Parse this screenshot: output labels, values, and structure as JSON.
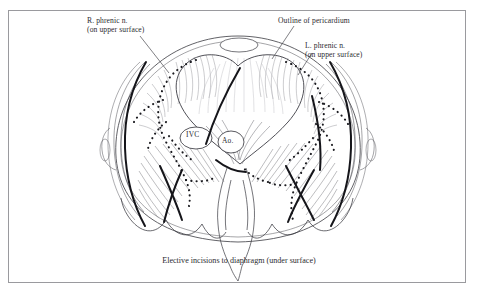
{
  "figure": {
    "kind": "anatomical-line-illustration",
    "background_color": "#ffffff",
    "frame_color": "#9a9a9e",
    "ink_color": "#2b2b2f",
    "shading_color": "#8e8e93"
  },
  "labels": {
    "r_phrenic_line1": "R. phrenic n.",
    "r_phrenic_line2": "(on upper surface)",
    "pericardium": "Outline of pericardium",
    "l_phrenic_line1": "L. phrenic n.",
    "l_phrenic_line2": "(on upper surface)",
    "ivc": "IVC",
    "aorta": "Ao."
  },
  "caption": {
    "main": "Elective incisions to diaphragm (under surface)",
    "page_footer": ""
  },
  "leader_lines": [
    {
      "name": "r-phrenic-leader",
      "from": [
        140,
        36
      ],
      "to": [
        168,
        72
      ]
    },
    {
      "name": "pericardium-leader",
      "from": [
        292,
        26
      ],
      "to": [
        272,
        58
      ]
    },
    {
      "name": "l-phrenic-leader",
      "from": [
        311,
        53
      ],
      "to": [
        297,
        74
      ]
    }
  ],
  "annotated_structures": [
    {
      "name": "right-phrenic-nerve",
      "style": "dotted",
      "surface": "upper"
    },
    {
      "name": "left-phrenic-nerve",
      "style": "dotted",
      "surface": "upper"
    },
    {
      "name": "pericardium-outline",
      "style": "solid-thin"
    },
    {
      "name": "elective-incision-right",
      "style": "solid-bold"
    },
    {
      "name": "elective-incision-left",
      "style": "solid-bold"
    },
    {
      "name": "inferior-vena-cava-foramen",
      "style": "oval"
    },
    {
      "name": "aortic-hiatus",
      "style": "oval"
    },
    {
      "name": "esophageal-hiatus",
      "style": "oval"
    },
    {
      "name": "costal-margin",
      "style": "scalloped-arcs"
    },
    {
      "name": "crus-of-diaphragm",
      "style": "outline"
    }
  ]
}
